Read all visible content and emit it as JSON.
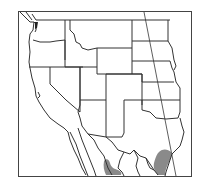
{
  "map": {
    "type": "species-range-map",
    "region": "Western United States and northern Mexico",
    "colors": {
      "background": "#ffffff",
      "border": "#333333",
      "frame": "#444444",
      "range_fill": "#8a8a8a"
    },
    "range_areas": [
      {
        "name": "south-texas-gulf-coast-range"
      },
      {
        "name": "northern-mexico-range"
      }
    ],
    "labels": []
  }
}
